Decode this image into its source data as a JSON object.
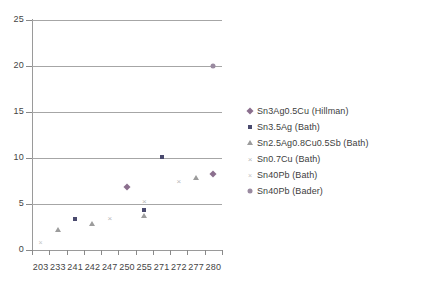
{
  "chart_data": {
    "type": "scatter",
    "title": "",
    "xlabel": "",
    "ylabel": "",
    "ylim": [
      0,
      25
    ],
    "yticks": [
      "0",
      "5",
      "10",
      "15",
      "20",
      "25"
    ],
    "categories": [
      "203",
      "233",
      "241",
      "242",
      "247",
      "250",
      "255",
      "271",
      "272",
      "277",
      "280"
    ],
    "grid": "horizontal",
    "legend_position": "right",
    "series": [
      {
        "name": "Sn3Ag0.5Cu (Hillman)",
        "marker": "diamond",
        "color": "#8b6f8e",
        "points": [
          {
            "x": "250",
            "y": 6.8
          },
          {
            "x": "280",
            "y": 8.3
          }
        ]
      },
      {
        "name": "Sn3.5Ag (Bath)",
        "marker": "square",
        "color": "#4a4a6e",
        "points": [
          {
            "x": "241",
            "y": 3.4
          },
          {
            "x": "255",
            "y": 4.3
          },
          {
            "x": "271",
            "y": 10.1
          }
        ]
      },
      {
        "name": "Sn2.5Ag0.8Cu0.5Sb (Bath)",
        "marker": "triangle",
        "color": "#9c9c9c",
        "points": [
          {
            "x": "233",
            "y": 2.2
          },
          {
            "x": "242",
            "y": 2.8
          },
          {
            "x": "255",
            "y": 3.7
          },
          {
            "x": "277",
            "y": 7.8
          }
        ]
      },
      {
        "name": "Sn0.7Cu (Bath)",
        "marker": "cross",
        "color": "#b9b9b9",
        "points": [
          {
            "x": "247",
            "y": 3.5
          },
          {
            "x": "255",
            "y": 5.3
          },
          {
            "x": "272",
            "y": 7.5
          }
        ]
      },
      {
        "name": "Sn40Pb (Bath)",
        "marker": "x-thin",
        "color": "#c4c4c4",
        "points": [
          {
            "x": "203",
            "y": 0.9
          }
        ]
      },
      {
        "name": "Sn40Pb (Bader)",
        "marker": "circle",
        "color": "#9a8aa0",
        "points": [
          {
            "x": "280",
            "y": 20.0
          }
        ]
      }
    ]
  }
}
